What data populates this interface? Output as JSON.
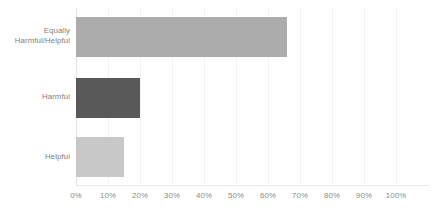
{
  "chart_data": {
    "type": "bar",
    "orientation": "horizontal",
    "title": "",
    "subtitle": "",
    "xlabel": "",
    "ylabel": "",
    "categories": [
      "Equally Harmful/Helpful",
      "Harmful",
      "Helpful"
    ],
    "values": [
      66,
      20,
      15
    ],
    "value_suffix": "%",
    "xlim": [
      0,
      100
    ],
    "xticks": [
      0,
      10,
      20,
      30,
      40,
      50,
      60,
      70,
      80,
      90,
      100
    ],
    "xtick_labels": [
      "0%",
      "10%",
      "20%",
      "30%",
      "40%",
      "50%",
      "60%",
      "70%",
      "80%",
      "90%",
      "100%"
    ],
    "grid": true,
    "legend": false,
    "bar_colors": [
      "#acacac",
      "#595959",
      "#c8c8c8"
    ],
    "background_color": "#ffffff",
    "label_color": "#7e7e7e",
    "tick_color": "#8a8a8a",
    "gridline_color": "#f2f2f2",
    "axis_color": "#e3e3e3"
  },
  "category_labels": [
    {
      "line1": "Equally",
      "line2": "Harmful/Helpful"
    },
    {
      "line1": "Harmful",
      "line2": ""
    },
    {
      "line1": "Helpful",
      "line2": ""
    }
  ]
}
